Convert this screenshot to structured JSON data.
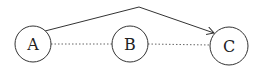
{
  "diagram": {
    "nodes": [
      {
        "id": "A",
        "label": "A",
        "cx": 33,
        "cy": 44,
        "r": 18
      },
      {
        "id": "B",
        "label": "B",
        "cx": 130,
        "cy": 44,
        "r": 18
      },
      {
        "id": "C",
        "label": "C",
        "cx": 229,
        "cy": 46,
        "r": 19
      }
    ],
    "edges": [
      {
        "from": "A",
        "to": "B",
        "style": "dotted"
      },
      {
        "from": "B",
        "to": "C",
        "style": "dotted"
      },
      {
        "from": "A",
        "to": "C",
        "style": "solid-arrow",
        "via": "apex"
      }
    ],
    "colors": {
      "stroke": "#333333",
      "dotted": "#666666",
      "background": "#ffffff"
    }
  }
}
